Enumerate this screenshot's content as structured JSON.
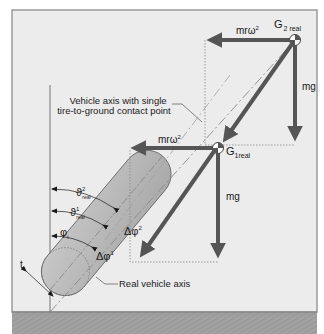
{
  "diagram": {
    "caption_axis": [
      "Vehicle axis with single",
      "tire-to-ground contact point"
    ],
    "real_axis_label": "Real vehicle axis",
    "forces": {
      "centrifugal_top": "mrω",
      "centrifugal_top_sup": "2",
      "gravity_top": "mg",
      "centrifugal_bottom": "mrω",
      "centrifugal_bottom_sup": "2",
      "gravity_bottom": "mg"
    },
    "points": {
      "g2": "G",
      "g2_sub": "2 real",
      "g1": "G",
      "g1_sub": "1real"
    },
    "angles": {
      "theta2": "ϑ",
      "theta2_sup": "2",
      "theta2_sub": "real",
      "theta1": "ϑ",
      "theta1_sup": "1",
      "theta1_sub": "real",
      "phi": "φ",
      "phi_sub": "i",
      "dphi2": "Δφ",
      "dphi2_sup": "2",
      "dphi1": "Δφ",
      "dphi1_sup": "1"
    },
    "tire_width_label": "t",
    "colors": {
      "panel": "#ececec",
      "ground": "#9c9c9c",
      "arrow": "#555555",
      "tire": "#b9b9b9"
    }
  }
}
